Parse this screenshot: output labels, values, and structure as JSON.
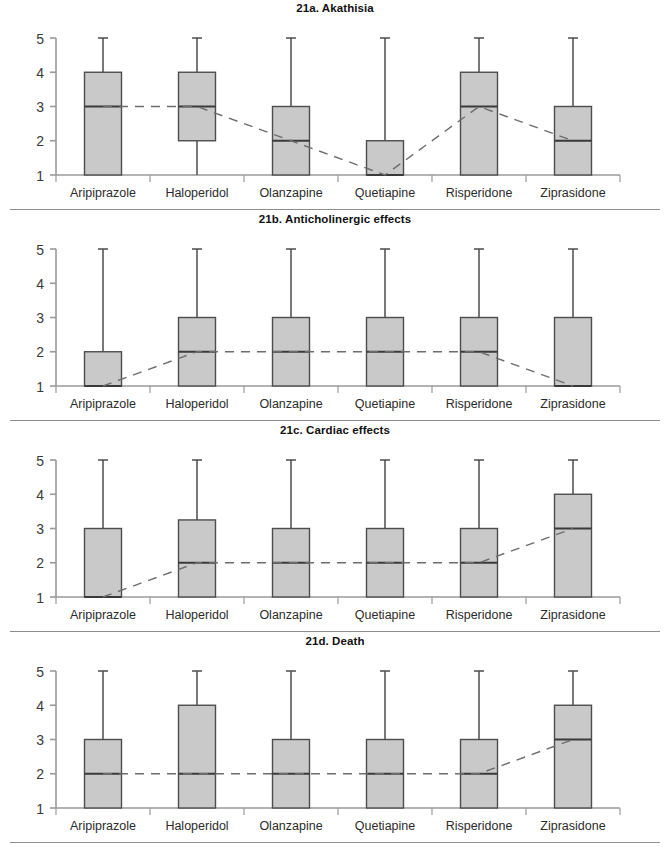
{
  "figure": {
    "categories": [
      "Aripiprazole",
      "Haloperidol",
      "Olanzapine",
      "Quetiapine",
      "Risperidone",
      "Ziprasidone"
    ],
    "y_ticks": [
      "5",
      "4",
      "3",
      "2",
      "1"
    ],
    "ylim": [
      1,
      5
    ],
    "box_fill": "#c9c9c9",
    "box_stroke": "#4d4d4d",
    "median_stroke": "#3a3a3a",
    "whisker_stroke": "#4d4d4d",
    "axis_stroke": "#9a9a9a",
    "dash_stroke": "#6d6d6d"
  },
  "panels": [
    {
      "id": "21a",
      "title": "21a. Akathisia",
      "separator": true
    },
    {
      "id": "21b",
      "title": "21b. Anticholinergic effects",
      "separator": true
    },
    {
      "id": "21c",
      "title": "21c. Cardiac effects",
      "separator": true
    },
    {
      "id": "21d",
      "title": "21d. Death",
      "separator": true
    }
  ],
  "chart_data": [
    {
      "type": "box",
      "title": "21a. Akathisia",
      "xlabel": "",
      "ylabel": "",
      "ylim": [
        1,
        5
      ],
      "yticks": [
        1,
        2,
        3,
        4,
        5
      ],
      "grid": false,
      "legend": "none",
      "categories": [
        "Aripiprazole",
        "Haloperidol",
        "Olanzapine",
        "Quetiapine",
        "Risperidone",
        "Ziprasidone"
      ],
      "boxes": [
        {
          "category": "Aripiprazole",
          "q1": 1,
          "median": 3,
          "q3": 4,
          "whisker_low": 1,
          "whisker_high": 5
        },
        {
          "category": "Haloperidol",
          "q1": 2,
          "median": 3,
          "q3": 4,
          "whisker_low": 1,
          "whisker_high": 5
        },
        {
          "category": "Olanzapine",
          "q1": 1,
          "median": 2,
          "q3": 3,
          "whisker_low": 1,
          "whisker_high": 5
        },
        {
          "category": "Quetiapine",
          "q1": 1,
          "median": 1,
          "q3": 2,
          "whisker_low": 1,
          "whisker_high": 5
        },
        {
          "category": "Risperidone",
          "q1": 1,
          "median": 3,
          "q3": 4,
          "whisker_low": 1,
          "whisker_high": 5
        },
        {
          "category": "Ziprasidone",
          "q1": 1,
          "median": 2,
          "q3": 3,
          "whisker_low": 1,
          "whisker_high": 5
        }
      ],
      "median_trend": [
        3,
        3,
        2,
        1,
        3,
        2
      ]
    },
    {
      "type": "box",
      "title": "21b. Anticholinergic effects",
      "xlabel": "",
      "ylabel": "",
      "ylim": [
        1,
        5
      ],
      "yticks": [
        1,
        2,
        3,
        4,
        5
      ],
      "grid": false,
      "legend": "none",
      "categories": [
        "Aripiprazole",
        "Haloperidol",
        "Olanzapine",
        "Quetiapine",
        "Risperidone",
        "Ziprasidone"
      ],
      "boxes": [
        {
          "category": "Aripiprazole",
          "q1": 1,
          "median": 1,
          "q3": 2,
          "whisker_low": 1,
          "whisker_high": 5
        },
        {
          "category": "Haloperidol",
          "q1": 1,
          "median": 2,
          "q3": 3,
          "whisker_low": 1,
          "whisker_high": 5
        },
        {
          "category": "Olanzapine",
          "q1": 1,
          "median": 2,
          "q3": 3,
          "whisker_low": 1,
          "whisker_high": 5
        },
        {
          "category": "Quetiapine",
          "q1": 1,
          "median": 2,
          "q3": 3,
          "whisker_low": 1,
          "whisker_high": 5
        },
        {
          "category": "Risperidone",
          "q1": 1,
          "median": 2,
          "q3": 3,
          "whisker_low": 1,
          "whisker_high": 5
        },
        {
          "category": "Ziprasidone",
          "q1": 1,
          "median": 1,
          "q3": 3,
          "whisker_low": 1,
          "whisker_high": 5
        }
      ],
      "median_trend": [
        1,
        2,
        2,
        2,
        2,
        1
      ]
    },
    {
      "type": "box",
      "title": "21c. Cardiac effects",
      "xlabel": "",
      "ylabel": "",
      "ylim": [
        1,
        5
      ],
      "yticks": [
        1,
        2,
        3,
        4,
        5
      ],
      "grid": false,
      "legend": "none",
      "categories": [
        "Aripiprazole",
        "Haloperidol",
        "Olanzapine",
        "Quetiapine",
        "Risperidone",
        "Ziprasidone"
      ],
      "boxes": [
        {
          "category": "Aripiprazole",
          "q1": 1,
          "median": 1,
          "q3": 3,
          "whisker_low": 1,
          "whisker_high": 5
        },
        {
          "category": "Haloperidol",
          "q1": 1,
          "median": 2,
          "q3": 3.25,
          "whisker_low": 1,
          "whisker_high": 5
        },
        {
          "category": "Olanzapine",
          "q1": 1,
          "median": 2,
          "q3": 3,
          "whisker_low": 1,
          "whisker_high": 5
        },
        {
          "category": "Quetiapine",
          "q1": 1,
          "median": 2,
          "q3": 3,
          "whisker_low": 1,
          "whisker_high": 5
        },
        {
          "category": "Risperidone",
          "q1": 1,
          "median": 2,
          "q3": 3,
          "whisker_low": 1,
          "whisker_high": 5
        },
        {
          "category": "Ziprasidone",
          "q1": 1,
          "median": 3,
          "q3": 4,
          "whisker_low": 1,
          "whisker_high": 5
        }
      ],
      "median_trend": [
        1,
        2,
        2,
        2,
        2,
        3
      ]
    },
    {
      "type": "box",
      "title": "21d. Death",
      "xlabel": "",
      "ylabel": "",
      "ylim": [
        1,
        5
      ],
      "yticks": [
        1,
        2,
        3,
        4,
        5
      ],
      "grid": false,
      "legend": "none",
      "categories": [
        "Aripiprazole",
        "Haloperidol",
        "Olanzapine",
        "Quetiapine",
        "Risperidone",
        "Ziprasidone"
      ],
      "boxes": [
        {
          "category": "Aripiprazole",
          "q1": 1,
          "median": 2,
          "q3": 3,
          "whisker_low": 1,
          "whisker_high": 5
        },
        {
          "category": "Haloperidol",
          "q1": 1,
          "median": 2,
          "q3": 4,
          "whisker_low": 1,
          "whisker_high": 5
        },
        {
          "category": "Olanzapine",
          "q1": 1,
          "median": 2,
          "q3": 3,
          "whisker_low": 1,
          "whisker_high": 5
        },
        {
          "category": "Quetiapine",
          "q1": 1,
          "median": 2,
          "q3": 3,
          "whisker_low": 1,
          "whisker_high": 5
        },
        {
          "category": "Risperidone",
          "q1": 1,
          "median": 2,
          "q3": 3,
          "whisker_low": 1,
          "whisker_high": 5
        },
        {
          "category": "Ziprasidone",
          "q1": 1,
          "median": 3,
          "q3": 4,
          "whisker_low": 1,
          "whisker_high": 5
        }
      ],
      "median_trend": [
        2,
        2,
        2,
        2,
        2,
        3
      ]
    }
  ]
}
